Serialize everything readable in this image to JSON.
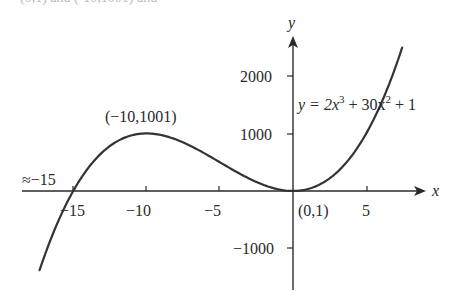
{
  "header_fragment": "(0,1) and (-10,1001) and",
  "chart_data": {
    "type": "line",
    "title": "",
    "equation": "y = 2x³ + 30x² + 1",
    "xlabel": "x",
    "ylabel": "y",
    "x_ticks": [
      -15,
      -10,
      -5,
      5
    ],
    "x_tick_labels": [
      "−15",
      "−10",
      "−5",
      "5"
    ],
    "y_ticks": [
      2000,
      1000,
      -1000
    ],
    "y_tick_labels": [
      "2000",
      "1000",
      "−1000"
    ],
    "xlim": [
      -17,
      8
    ],
    "ylim": [
      -1600,
      2600
    ],
    "grid": false,
    "legend": null,
    "series": [
      {
        "name": "y = 2x^3 + 30x^2 + 1",
        "function": "2*x^3 + 30*x^2 + 1",
        "x_range": [
          -17.5,
          7.5
        ],
        "points": [
          {
            "x": -17,
            "y": -1155
          },
          {
            "x": -15,
            "y": 1
          },
          {
            "x": -10,
            "y": 1001
          },
          {
            "x": -5,
            "y": 501
          },
          {
            "x": 0,
            "y": 1
          },
          {
            "x": 5,
            "y": 1001
          },
          {
            "x": 7.5,
            "y": 2533
          }
        ]
      }
    ],
    "annotations": [
      {
        "text": "(−10,1001)",
        "x": -10,
        "y": 1001,
        "note": "local maximum"
      },
      {
        "text": "(0,1)",
        "x": 0,
        "y": 1,
        "note": "local minimum"
      },
      {
        "text": "≈−15",
        "x": -15,
        "y": 0,
        "note": "x-intercept"
      }
    ]
  },
  "labels": {
    "x_axis": "x",
    "y_axis": "y",
    "equation_prefix": "y = 2x",
    "equation_exp1": "3",
    "equation_mid": " + 30x",
    "equation_exp2": "2",
    "equation_suffix": " + 1",
    "max_point": "(−10,1001)",
    "min_point": "(0,1)",
    "root": "≈−15",
    "xt_m15": "−15",
    "xt_m10": "−10",
    "xt_m5": "−5",
    "xt_5": "5",
    "yt_2000": "2000",
    "yt_1000": "1000",
    "yt_m1000": "−1000"
  }
}
